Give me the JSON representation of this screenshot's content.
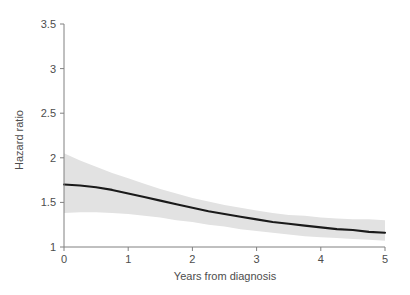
{
  "chart_data": {
    "type": "line",
    "title": "",
    "subtitle": "",
    "xlabel": "Years from diagnosis",
    "ylabel": "Hazard ratio",
    "xlim": [
      0,
      5
    ],
    "ylim": [
      1,
      3.5
    ],
    "xticks": [
      0,
      1,
      2,
      3,
      4,
      5
    ],
    "xtick_labels": [
      "0",
      "1",
      "2",
      "3",
      "4",
      "5"
    ],
    "yticks": [
      1,
      1.5,
      2,
      2.5,
      3,
      3.5
    ],
    "ytick_labels": [
      "1",
      "1.5",
      "2",
      "2.5",
      "3",
      "3.5"
    ],
    "grid": false,
    "legend": null,
    "annotations": [],
    "x": [
      0,
      0.25,
      0.5,
      0.75,
      1,
      1.25,
      1.5,
      1.75,
      2,
      2.25,
      2.5,
      2.75,
      3,
      3.25,
      3.5,
      3.75,
      4,
      4.25,
      4.5,
      4.75,
      5
    ],
    "series": [
      {
        "name": "Hazard ratio estimate",
        "role": "line",
        "color": "#1a1a1a",
        "values": [
          1.7,
          1.69,
          1.67,
          1.64,
          1.6,
          1.56,
          1.52,
          1.48,
          1.44,
          1.4,
          1.37,
          1.34,
          1.31,
          1.28,
          1.26,
          1.24,
          1.22,
          1.2,
          1.19,
          1.17,
          1.16
        ]
      },
      {
        "name": "95% confidence band upper",
        "role": "band-upper",
        "color": "#e2e2e2",
        "values": [
          2.05,
          1.97,
          1.9,
          1.83,
          1.77,
          1.71,
          1.65,
          1.6,
          1.55,
          1.51,
          1.47,
          1.44,
          1.41,
          1.38,
          1.36,
          1.35,
          1.33,
          1.32,
          1.31,
          1.31,
          1.3
        ]
      },
      {
        "name": "95% confidence band lower",
        "role": "band-lower",
        "color": "#e2e2e2",
        "values": [
          1.38,
          1.39,
          1.39,
          1.38,
          1.37,
          1.35,
          1.33,
          1.3,
          1.28,
          1.25,
          1.23,
          1.2,
          1.18,
          1.16,
          1.14,
          1.12,
          1.11,
          1.1,
          1.09,
          1.08,
          1.07
        ]
      }
    ]
  },
  "style": {
    "axis_color": "#808080",
    "text_color": "#4d4d4d",
    "line_color": "#1a1a1a",
    "band_color": "#e2e2e2",
    "background": "#ffffff"
  }
}
